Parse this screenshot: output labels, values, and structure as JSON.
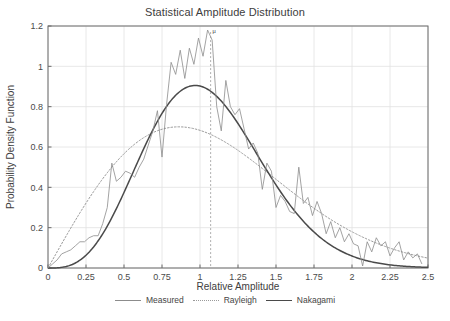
{
  "chart_data": {
    "type": "line",
    "title": "Statistical Amplitude Distribution",
    "xlabel": "Relative Amplitude",
    "ylabel": "Probability Density Function",
    "xlim": [
      0,
      2.5
    ],
    "ylim": [
      0,
      1.2
    ],
    "xticks": [
      "0",
      "0.25",
      "0.5",
      "0.75",
      "1",
      "1.25",
      "1.5",
      "1.75",
      "2",
      "2.25",
      "2.5"
    ],
    "xtick_values": [
      0,
      0.25,
      0.5,
      0.75,
      1,
      1.25,
      1.5,
      1.75,
      2,
      2.25,
      2.5
    ],
    "yticks": [
      "0",
      "0.2",
      "0.4",
      "0.6",
      "0.8",
      "1",
      "1.2"
    ],
    "ytick_values": [
      0,
      0.2,
      0.4,
      0.6,
      0.8,
      1,
      1.2
    ],
    "grid": true,
    "legend_position": "below",
    "annotations": [
      {
        "text": "μ",
        "x": 1.07,
        "y": 1.17,
        "line": "vertical-dashed",
        "name": "mu-marker"
      }
    ],
    "series": [
      {
        "name": "Measured",
        "style": "solid-thin",
        "color": "#8c8c8c",
        "x": [
          0.0,
          0.03,
          0.06,
          0.09,
          0.12,
          0.15,
          0.18,
          0.21,
          0.24,
          0.27,
          0.3,
          0.33,
          0.36,
          0.39,
          0.42,
          0.45,
          0.48,
          0.51,
          0.54,
          0.57,
          0.6,
          0.63,
          0.66,
          0.69,
          0.72,
          0.75,
          0.78,
          0.81,
          0.84,
          0.87,
          0.9,
          0.93,
          0.96,
          0.99,
          1.02,
          1.05,
          1.08,
          1.11,
          1.14,
          1.17,
          1.2,
          1.23,
          1.26,
          1.29,
          1.32,
          1.35,
          1.38,
          1.41,
          1.44,
          1.47,
          1.5,
          1.53,
          1.56,
          1.59,
          1.62,
          1.65,
          1.68,
          1.71,
          1.74,
          1.77,
          1.8,
          1.83,
          1.86,
          1.89,
          1.92,
          1.95,
          1.98,
          2.01,
          2.04,
          2.07,
          2.1,
          2.13,
          2.16,
          2.19,
          2.22,
          2.25,
          2.28,
          2.31,
          2.34,
          2.37,
          2.4,
          2.43,
          2.46
        ],
        "y": [
          0.0,
          0.02,
          0.04,
          0.07,
          0.08,
          0.09,
          0.11,
          0.13,
          0.13,
          0.15,
          0.16,
          0.16,
          0.22,
          0.3,
          0.52,
          0.43,
          0.45,
          0.48,
          0.47,
          0.45,
          0.5,
          0.54,
          0.61,
          0.68,
          0.78,
          0.55,
          0.81,
          1.02,
          0.96,
          1.08,
          0.94,
          1.09,
          1.01,
          1.14,
          1.05,
          1.18,
          1.13,
          0.8,
          0.68,
          0.93,
          0.8,
          0.76,
          0.79,
          0.69,
          0.59,
          0.62,
          0.57,
          0.39,
          0.52,
          0.48,
          0.3,
          0.36,
          0.33,
          0.28,
          0.27,
          0.5,
          0.32,
          0.35,
          0.26,
          0.33,
          0.27,
          0.17,
          0.23,
          0.15,
          0.2,
          0.13,
          0.17,
          0.12,
          0.11,
          0.01,
          0.13,
          0.08,
          0.15,
          0.11,
          0.13,
          0.06,
          0.1,
          0.13,
          0.04,
          0.08,
          0.05,
          0.07,
          0.02
        ]
      },
      {
        "name": "Rayleigh",
        "style": "dotted",
        "color": "#9a9a9a",
        "peak_y": 0.7,
        "peak_x": 0.86,
        "sigma": 0.86
      },
      {
        "name": "Nakagami",
        "style": "solid-thick",
        "color": "#4a4a4a",
        "peak_y": 0.905,
        "peak_x": 0.95,
        "m": 2.0,
        "omega": 1.25
      }
    ]
  },
  "legend": {
    "items": [
      {
        "label": "Measured"
      },
      {
        "label": "Rayleigh"
      },
      {
        "label": "Nakagami"
      }
    ]
  },
  "colors": {
    "background": "#ffffff",
    "grid": "#e2e2e2",
    "axis": "#6b6b6b",
    "measured": "#8c8c8c",
    "rayleigh": "#9a9a9a",
    "nakagami": "#4a4a4a",
    "text": "#3d3d3d"
  }
}
